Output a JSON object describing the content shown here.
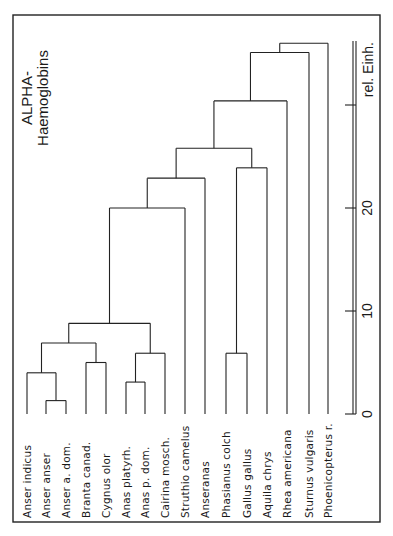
{
  "title": {
    "line1": "ALPHA-",
    "line2": "Haemoglobins"
  },
  "axis": {
    "unit_label": "rel. Einh.",
    "ticks": [
      {
        "value": 0,
        "label": "0"
      },
      {
        "value": 10,
        "label": "10"
      },
      {
        "value": 20,
        "label": "20"
      },
      {
        "value": 30,
        "label": ""
      }
    ]
  },
  "leaves": [
    "Anser indicus",
    "Anser anser",
    "Anser a. dom.",
    "Branta canad.",
    "Cygnus olor",
    "Anas platyrh.",
    "Anas p. dom.",
    "Cairina mosch.",
    "Struthio camelus",
    "Anseranas",
    "Phasianus colch",
    "Gallus gallus",
    "Aquila chrys",
    "Rhea americana",
    "Sturnus vulgaris",
    "Phoenicopterus r."
  ],
  "chart_data": {
    "type": "dendrogram",
    "title": "ALPHA- Haemoglobins",
    "axis_label": "rel. Einh.",
    "axis_range": [
      0,
      36
    ],
    "orientation": "rotated 90deg; leaves at bottom, distance increases upward",
    "leaves": [
      "Anser indicus",
      "Anser anser",
      "Anser a. dom.",
      "Branta canad.",
      "Cygnus olor",
      "Anas platyrh.",
      "Anas p. dom.",
      "Cairina mosch.",
      "Struthio camelus",
      "Anseranas",
      "Phasianus colch",
      "Gallus gallus",
      "Aquila chrys",
      "Rhea americana",
      "Sturnus vulgaris",
      "Phoenicopterus r."
    ],
    "merges": [
      {
        "id": "n1",
        "children": [
          "Anser anser",
          "Anser a. dom."
        ],
        "height": 1.3
      },
      {
        "id": "n2",
        "children": [
          "Anas platyrh.",
          "Anas p. dom."
        ],
        "height": 3.1
      },
      {
        "id": "n3",
        "children": [
          "Anser indicus",
          "n1"
        ],
        "height": 4.0
      },
      {
        "id": "n4",
        "children": [
          "Branta canad.",
          "Cygnus olor"
        ],
        "height": 5.0
      },
      {
        "id": "n5",
        "children": [
          "Phasianus colch",
          "Gallus gallus"
        ],
        "height": 5.9
      },
      {
        "id": "n6",
        "children": [
          "n2",
          "Cairina mosch."
        ],
        "height": 5.9
      },
      {
        "id": "n7",
        "children": [
          "n3",
          "n4"
        ],
        "height": 6.9
      },
      {
        "id": "n8",
        "children": [
          "n7",
          "n6"
        ],
        "height": 8.8
      },
      {
        "id": "n9",
        "children": [
          "n8",
          "Struthio camelus"
        ],
        "height": 20.0
      },
      {
        "id": "n10",
        "children": [
          "n9",
          "Anseranas"
        ],
        "height": 22.9
      },
      {
        "id": "n11",
        "children": [
          "n5",
          "Aquila chrys"
        ],
        "height": 23.9
      },
      {
        "id": "n12",
        "children": [
          "n10",
          "n11"
        ],
        "height": 25.8
      },
      {
        "id": "n13",
        "children": [
          "n12",
          "Rhea americana"
        ],
        "height": 30.4
      },
      {
        "id": "n14",
        "children": [
          "n13",
          "Sturnus vulgaris"
        ],
        "height": 35.1
      },
      {
        "id": "n15",
        "children": [
          "n14",
          "Phoenicopterus r."
        ],
        "height": 36.0
      }
    ]
  }
}
